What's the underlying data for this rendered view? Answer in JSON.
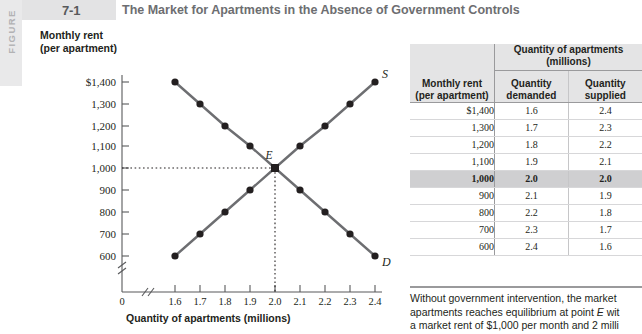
{
  "figure": {
    "spine_label": "FIGURE",
    "number": "7-1",
    "title": "The Market for Apartments in the Absence of Government Controls"
  },
  "chart_data": {
    "type": "line",
    "title": "The Market for Apartments in the Absence of Government Controls",
    "xlabel": "Quantity of apartments (millions)",
    "ylabel": "Monthly rent (per apartment)",
    "xlim": [
      1.55,
      2.45
    ],
    "ylim": [
      560,
      1440
    ],
    "xticks": [
      "1.6",
      "1.7",
      "1.8",
      "1.9",
      "2.0",
      "2.1",
      "2.2",
      "2.3",
      "2.4"
    ],
    "yticks": [
      "$1,400",
      "1,300",
      "1,200",
      "1,100",
      "1,000",
      "900",
      "800",
      "700",
      "600"
    ],
    "origin_label": "0",
    "axis_break": true,
    "grid": false,
    "legend": "inline-curve-labels",
    "series": [
      {
        "name": "D",
        "label": "D",
        "role": "demand",
        "x": [
          1.6,
          1.7,
          1.8,
          1.9,
          2.0,
          2.1,
          2.2,
          2.3,
          2.4
        ],
        "y": [
          1400,
          1300,
          1200,
          1100,
          1000,
          900,
          800,
          700,
          600
        ]
      },
      {
        "name": "S",
        "label": "S",
        "role": "supply",
        "x": [
          1.6,
          1.7,
          1.8,
          1.9,
          2.0,
          2.1,
          2.2,
          2.3,
          2.4
        ],
        "y": [
          600,
          700,
          800,
          900,
          1000,
          1100,
          1200,
          1300,
          1400
        ]
      }
    ],
    "annotations": [
      {
        "label": "E",
        "x": 2.0,
        "y": 1000,
        "note": "equilibrium point"
      }
    ]
  },
  "table": {
    "header_rent": "Monthly rent",
    "header_rent_sub": "(per apartment)",
    "header_group": "Quantity of apartments",
    "header_group_sub": "(millions)",
    "header_demanded": "Quantity",
    "header_demanded_sub": "demanded",
    "header_supplied": "Quantity",
    "header_supplied_sub": "supplied",
    "rows": [
      {
        "rent": "$1,400",
        "demanded": "1.6",
        "supplied": "2.4",
        "equilibrium": false
      },
      {
        "rent": "1,300",
        "demanded": "1.7",
        "supplied": "2.3",
        "equilibrium": false
      },
      {
        "rent": "1,200",
        "demanded": "1.8",
        "supplied": "2.2",
        "equilibrium": false
      },
      {
        "rent": "1,100",
        "demanded": "1.9",
        "supplied": "2.1",
        "equilibrium": false
      },
      {
        "rent": "1,000",
        "demanded": "2.0",
        "supplied": "2.0",
        "equilibrium": true
      },
      {
        "rent": "900",
        "demanded": "2.1",
        "supplied": "1.9",
        "equilibrium": false
      },
      {
        "rent": "800",
        "demanded": "2.2",
        "supplied": "1.8",
        "equilibrium": false
      },
      {
        "rent": "700",
        "demanded": "2.3",
        "supplied": "1.7",
        "equilibrium": false
      },
      {
        "rent": "600",
        "demanded": "2.4",
        "supplied": "1.6",
        "equilibrium": false
      }
    ]
  },
  "caption": {
    "line1": "Without government intervention, the market ",
    "line2_a": "apartments reaches equilibrium at point ",
    "line2_em": "E",
    "line2_b": " wit",
    "line3": "a market rent of $1,000 per month and 2 milli"
  }
}
